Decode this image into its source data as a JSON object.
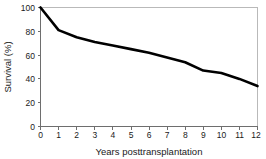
{
  "chart_data": {
    "type": "line",
    "title": "",
    "xlabel": "Years posttransplantation",
    "ylabel": "Survival (%)",
    "xlim": [
      0,
      12
    ],
    "ylim": [
      0,
      100
    ],
    "grid": false,
    "legend": null,
    "x": [
      0,
      1,
      2,
      3,
      4,
      5,
      6,
      7,
      8,
      9,
      10,
      11,
      12
    ],
    "xticks": [
      "0",
      "1",
      "2",
      "3",
      "4",
      "5",
      "6",
      "7",
      "8",
      "9",
      "10",
      "11",
      "12"
    ],
    "yticks": [
      "0",
      "20",
      "40",
      "60",
      "80",
      "100"
    ],
    "ytick_values": [
      0,
      20,
      40,
      60,
      80,
      100
    ],
    "series": [
      {
        "name": "Survival",
        "color": "#000000",
        "values": [
          100,
          81,
          75,
          71,
          68,
          65,
          62,
          58,
          54,
          47,
          45,
          40,
          34
        ]
      }
    ]
  },
  "axes": {
    "frame_color": "#b9b9b9",
    "axis_color": "#6e6e6e",
    "background": "#ffffff"
  }
}
